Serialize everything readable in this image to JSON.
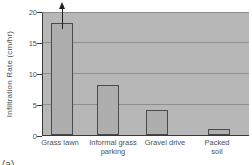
{
  "figure": {
    "caption_fragment": "(a)"
  },
  "chart_data": {
    "type": "bar",
    "title": "",
    "ylabel": "Infiltration Rate (cm/hr)",
    "xlabel": "",
    "ylim": [
      0,
      20
    ],
    "yticks": [
      0,
      5,
      10,
      15,
      20
    ],
    "categories": [
      "Grass lawn",
      "Informal grass\nparking",
      "Gravel drive",
      "Packed\nsoil"
    ],
    "values": [
      18,
      8,
      4,
      1
    ],
    "grid": true,
    "legend": false,
    "annotations": [
      {
        "type": "arrow-up",
        "category_index": 0,
        "note": "bar extends beyond top of axis"
      }
    ],
    "colors": {
      "plot_background": "#b7b7b7",
      "bar_fill": "#aeaeae",
      "bar_border": "#4a4a4a",
      "gridline": "#8f8f8f",
      "axis": "#3a3a3a",
      "text": "#4f4f4f",
      "arrow": "#1f1f1f"
    }
  }
}
